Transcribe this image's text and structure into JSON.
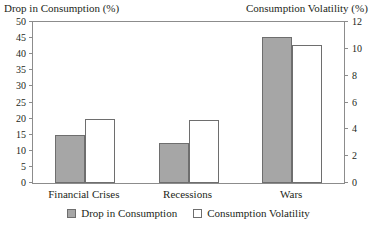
{
  "chart_data": {
    "type": "bar",
    "title": "",
    "categories": [
      "Financial Crises",
      "Recessions",
      "Wars"
    ],
    "series": [
      {
        "name": "Drop in Consumption",
        "axis": "left",
        "color": "#a6a6a6",
        "values": [
          15,
          12.5,
          45.5
        ]
      },
      {
        "name": "Consumption Volatility",
        "axis": "right",
        "color": "#ffffff",
        "values": [
          4.8,
          4.7,
          10.3
        ]
      }
    ],
    "ylabel": "Drop in Consumption (%)",
    "y2label": "Consumption Volatility (%)",
    "xlabel": "",
    "ylim": [
      0,
      50
    ],
    "y2lim": [
      0,
      12
    ],
    "yticks": [
      0,
      5,
      10,
      15,
      20,
      25,
      30,
      35,
      40,
      45,
      50
    ],
    "y2ticks": [
      0,
      2,
      4,
      6,
      8,
      10,
      12
    ],
    "grid": false,
    "legend_position": "bottom"
  },
  "axes": {
    "left_title": "Drop in Consumption (%)",
    "right_title": "Consumption Volatility (%)",
    "left_ticks": [
      "0",
      "5",
      "10",
      "15",
      "20",
      "25",
      "30",
      "35",
      "40",
      "45",
      "50"
    ],
    "right_ticks": [
      "0",
      "2",
      "4",
      "6",
      "8",
      "10",
      "12"
    ]
  },
  "categories": [
    "Financial Crises",
    "Recessions",
    "Wars"
  ],
  "legend": {
    "items": [
      {
        "label": "Drop in Consumption",
        "swatch": "gray"
      },
      {
        "label": "Consumption Volatility",
        "swatch": "white"
      }
    ]
  }
}
